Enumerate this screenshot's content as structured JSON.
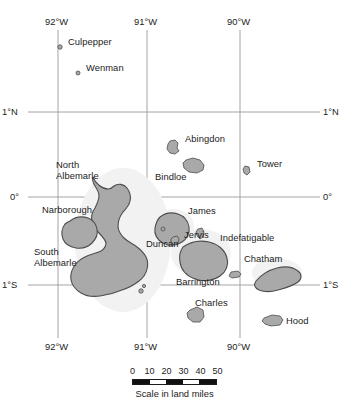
{
  "figure": {
    "kind": "reference-map",
    "background_color": "#ffffff",
    "island_fill_color": "#a9a9a9",
    "island_outline_color": "#4d4d4d",
    "grid_color": "#9a9a9a"
  },
  "graticule": {
    "longitudes": [
      {
        "label": "92°W",
        "x": 58
      },
      {
        "label": "91°W",
        "x": 147
      },
      {
        "label": "90°W",
        "x": 240
      }
    ],
    "latitudes": [
      {
        "label": "1°N",
        "y": 112
      },
      {
        "label": "0°",
        "y": 197
      },
      {
        "label": "1°S",
        "y": 285
      }
    ],
    "top_label_y": 22,
    "bottom_label_y": 344
  },
  "islands": [
    {
      "name": "Culpepper",
      "label_x": 68,
      "label_y": 42,
      "marker_x": 60,
      "marker_y": 47
    },
    {
      "name": "Wenman",
      "label_x": 86,
      "label_y": 68,
      "marker_x": 78,
      "marker_y": 73
    },
    {
      "name": "Abingdon",
      "label_x": 185,
      "label_y": 139,
      "marker_x": 172,
      "marker_y": 147
    },
    {
      "name": "Tower",
      "label_x": 257,
      "label_y": 164,
      "marker_x": 246,
      "marker_y": 170
    },
    {
      "name": "Bindloe",
      "label_x": 158,
      "label_y": 177,
      "marker_x": 192,
      "marker_y": 165
    },
    {
      "name": "North\nAlbemarle",
      "label_x": 58,
      "label_y": 163,
      "marker_x": 0,
      "marker_y": 0
    },
    {
      "name": "Narborough",
      "label_x": 44,
      "label_y": 209,
      "marker_x": 0,
      "marker_y": 0
    },
    {
      "name": "James",
      "label_x": 190,
      "label_y": 211,
      "marker_x": 0,
      "marker_y": 0
    },
    {
      "name": "Jervis",
      "label_x": 185,
      "label_y": 235,
      "marker_x": 0,
      "marker_y": 0
    },
    {
      "name": "Duncan",
      "label_x": 148,
      "label_y": 243,
      "marker_x": 0,
      "marker_y": 0
    },
    {
      "name": "Indefatigable",
      "label_x": 222,
      "label_y": 237,
      "marker_x": 0,
      "marker_y": 0
    },
    {
      "name": "South\nAlbemarle",
      "label_x": 36,
      "label_y": 251,
      "marker_x": 0,
      "marker_y": 0
    },
    {
      "name": "Chatham",
      "label_x": 246,
      "label_y": 258,
      "marker_x": 0,
      "marker_y": 0
    },
    {
      "name": "Barrington",
      "label_x": 178,
      "label_y": 281,
      "marker_x": 0,
      "marker_y": 0
    },
    {
      "name": "Charles",
      "label_x": 197,
      "label_y": 302,
      "marker_x": 0,
      "marker_y": 0
    },
    {
      "name": "Hood",
      "label_x": 283,
      "label_y": 320,
      "marker_x": 0,
      "marker_y": 0
    }
  ],
  "scale": {
    "ticks": [
      "0",
      "10",
      "20",
      "30",
      "40",
      "50"
    ],
    "segments": [
      "dark",
      "light",
      "dark",
      "light",
      "dark"
    ],
    "caption": "Scale in land miles",
    "units": "land miles",
    "max_value": 50,
    "step": 10
  }
}
